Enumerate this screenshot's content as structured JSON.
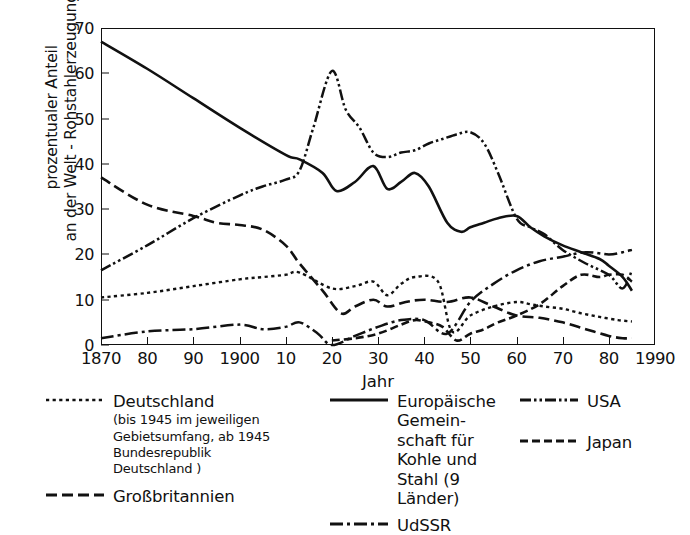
{
  "chart_data": {
    "type": "line",
    "title": "",
    "xlabel": "Jahr",
    "ylabel": "prozentualer Anteil an der Welt - Rohstahlerzeugung",
    "ylabel_line1": "prozentualer Anteil",
    "ylabel_line2": "an der Welt - Rohstahlerzeugung",
    "xlim": [
      1870,
      1990
    ],
    "ylim": [
      0,
      70
    ],
    "grid": false,
    "legend_position": "below",
    "y_ticks": [
      0,
      10,
      20,
      30,
      40,
      50,
      60,
      70
    ],
    "y_tick_labels": [
      "0",
      "10",
      "20",
      "30",
      "40",
      "50",
      "60",
      "70"
    ],
    "x_ticks": [
      1870,
      1880,
      1890,
      1900,
      1910,
      1920,
      1930,
      1940,
      1950,
      1960,
      1970,
      1980,
      1990
    ],
    "x_tick_labels": [
      "1870",
      "80",
      "90",
      "1900",
      "10",
      "20",
      "30",
      "40",
      "50",
      "60",
      "70",
      "80",
      "1990"
    ],
    "series": [
      {
        "name": "Deutschland",
        "style": "dotted",
        "x": [
          1870,
          1880,
          1890,
          1900,
          1905,
          1910,
          1913,
          1920,
          1925,
          1929,
          1932,
          1935,
          1938,
          1943,
          1946,
          1950,
          1955,
          1960,
          1963,
          1966,
          1970,
          1974,
          1978,
          1982,
          1985
        ],
        "y": [
          10.5,
          11.5,
          13.0,
          14.5,
          15.0,
          15.5,
          16.0,
          12.5,
          13.0,
          14.0,
          11.0,
          13.5,
          15.0,
          14.0,
          3.0,
          6.5,
          8.5,
          9.5,
          9.0,
          8.5,
          8.0,
          7.0,
          6.2,
          5.5,
          5.2
        ]
      },
      {
        "name": "Großbritannien",
        "style": "dashed-long",
        "x": [
          1870,
          1880,
          1890,
          1895,
          1900,
          1905,
          1910,
          1913,
          1918,
          1922,
          1925,
          1929,
          1932,
          1936,
          1940,
          1945,
          1950,
          1955,
          1960,
          1965,
          1970,
          1975,
          1980,
          1983,
          1985
        ],
        "y": [
          37.0,
          31.0,
          28.5,
          27.0,
          26.5,
          25.5,
          22.0,
          18.0,
          12.0,
          7.0,
          8.5,
          10.0,
          8.5,
          9.5,
          10.0,
          9.5,
          10.5,
          8.5,
          6.5,
          6.0,
          5.0,
          3.5,
          2.0,
          1.5,
          1.5
        ]
      },
      {
        "name": "Europäische Gemeinschaft für Kohle und Stahl (9 Länder)",
        "style": "solid",
        "x": [
          1870,
          1880,
          1890,
          1900,
          1910,
          1913,
          1918,
          1921,
          1925,
          1929,
          1932,
          1935,
          1938,
          1941,
          1945,
          1948,
          1950,
          1953,
          1956,
          1960,
          1963,
          1966,
          1970,
          1974,
          1978,
          1980,
          1983,
          1985
        ],
        "y": [
          67.0,
          61.0,
          54.5,
          48.0,
          42.0,
          41.0,
          38.0,
          34.0,
          36.0,
          39.5,
          34.5,
          36.0,
          38.0,
          35.0,
          27.0,
          25.0,
          26.0,
          27.0,
          28.0,
          28.5,
          26.0,
          24.0,
          22.0,
          20.5,
          19.0,
          17.5,
          15.0,
          12.0
        ]
      },
      {
        "name": "UdSSR",
        "style": "dash-dot",
        "x": [
          1870,
          1880,
          1890,
          1900,
          1905,
          1910,
          1913,
          1917,
          1920,
          1925,
          1930,
          1935,
          1940,
          1945,
          1950,
          1955,
          1960,
          1965,
          1970,
          1975,
          1980,
          1983,
          1985
        ],
        "y": [
          1.5,
          3.0,
          3.5,
          4.5,
          3.5,
          4.0,
          5.0,
          2.5,
          0.0,
          2.0,
          4.0,
          5.5,
          5.5,
          2.5,
          9.5,
          13.5,
          16.5,
          18.5,
          19.5,
          20.5,
          20.0,
          20.5,
          21.0
        ]
      },
      {
        "name": "USA",
        "style": "dash-dot-dot",
        "x": [
          1870,
          1880,
          1890,
          1900,
          1905,
          1910,
          1913,
          1916,
          1920,
          1923,
          1926,
          1929,
          1932,
          1935,
          1938,
          1941,
          1944,
          1947,
          1950,
          1953,
          1956,
          1960,
          1963,
          1966,
          1970,
          1975,
          1980,
          1983,
          1985
        ],
        "y": [
          16.5,
          22.0,
          28.0,
          33.0,
          35.0,
          36.5,
          38.5,
          48.0,
          60.5,
          52.0,
          48.0,
          42.5,
          41.5,
          42.5,
          43.0,
          44.5,
          45.5,
          46.5,
          47.0,
          44.5,
          38.0,
          28.0,
          26.0,
          24.5,
          21.0,
          18.0,
          15.5,
          12.5,
          16.5
        ]
      },
      {
        "name": "Japan",
        "style": "dashed-medium",
        "x": [
          1920,
          1925,
          1930,
          1935,
          1938,
          1941,
          1944,
          1947,
          1950,
          1953,
          1956,
          1960,
          1965,
          1970,
          1974,
          1978,
          1980,
          1983,
          1985
        ],
        "y": [
          1.0,
          1.5,
          2.5,
          4.5,
          5.5,
          5.0,
          4.0,
          1.0,
          2.5,
          3.5,
          5.0,
          6.5,
          9.0,
          13.0,
          15.5,
          15.0,
          15.5,
          15.5,
          14.0
        ]
      }
    ]
  },
  "axis": {
    "x_title": "Jahr",
    "y_title_line1": "prozentualer Anteil",
    "y_title_line2": "an der Welt - Rohstahlerzeugung"
  },
  "legend": {
    "deutschland": {
      "label": "Deutschland",
      "sub_line1": "(bis 1945 im jeweiligen",
      "sub_line2": "Gebietsumfang, ab 1945",
      "sub_line3": "Bundesrepublik",
      "sub_line4": "Deutschland )"
    },
    "grossbritannien": {
      "label": "Großbritannien"
    },
    "egks": {
      "line1": "Europäische Gemein-",
      "line2": "schaft für Kohle und",
      "line3": "Stahl (9 Länder)"
    },
    "udssr": {
      "label": "UdSSR"
    },
    "usa": {
      "label": "USA"
    },
    "japan": {
      "label": "Japan"
    }
  },
  "colors": {
    "ink": "#111111",
    "background": "#ffffff"
  }
}
